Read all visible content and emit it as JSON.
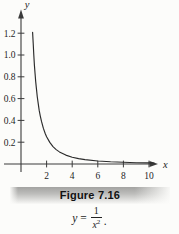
{
  "figure": {
    "caption": "Figure 7.16"
  },
  "equation": {
    "lhs": "y",
    "equals": "=",
    "numerator": "1",
    "denominator_base": "x",
    "denominator_exponent": "2",
    "period": "."
  },
  "chart_data": {
    "type": "line",
    "title": "Figure 7.16",
    "equation": "y = 1/x^2",
    "xlabel": "x",
    "ylabel": "y",
    "xlim": [
      -1.5,
      11
    ],
    "ylim": [
      0,
      1.38
    ],
    "x_ticks": [
      2,
      4,
      6,
      8,
      10
    ],
    "y_ticks": [
      0.2,
      0.4,
      0.6,
      0.8,
      1.0,
      1.2
    ],
    "grid": false,
    "legend": "none",
    "series": [
      {
        "name": "y = 1/x^2",
        "x": [
          0.91,
          0.95,
          1.0,
          1.05,
          1.1,
          1.15,
          1.2,
          1.275,
          1.35,
          1.425,
          1.5,
          1.6,
          1.75,
          1.9,
          2.0,
          2.25,
          2.5,
          2.75,
          3.0,
          3.5,
          4.0,
          4.5,
          5.0,
          6.0,
          7.0,
          8.0,
          9.0,
          10.0,
          10.4
        ],
        "y": [
          1.2075,
          1.108,
          1.0,
          0.907,
          0.826,
          0.756,
          0.694,
          0.615,
          0.549,
          0.492,
          0.444,
          0.391,
          0.327,
          0.277,
          0.25,
          0.198,
          0.16,
          0.132,
          0.111,
          0.0816,
          0.0625,
          0.0494,
          0.04,
          0.0278,
          0.0204,
          0.0156,
          0.0123,
          0.01,
          0.0092
        ]
      }
    ],
    "colors": {
      "curve": "#2b2b2b",
      "axis": "#3a3a3a",
      "text": "#1e1e1e"
    }
  }
}
